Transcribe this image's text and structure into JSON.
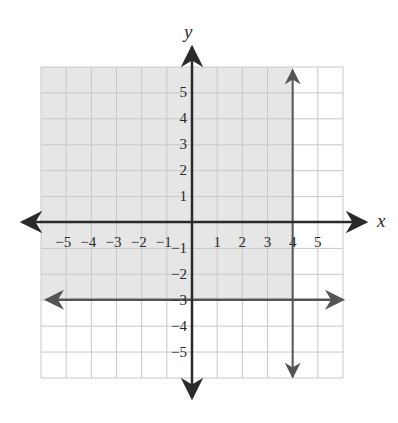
{
  "chart_data": {
    "type": "line",
    "title": "",
    "xlabel": "x",
    "ylabel": "y",
    "xlim": [
      -6,
      6
    ],
    "ylim": [
      -6,
      6
    ],
    "grid": true,
    "x_ticks": [
      -5,
      -4,
      -3,
      -2,
      -1,
      1,
      2,
      3,
      4,
      5
    ],
    "y_ticks": [
      5,
      4,
      3,
      2,
      1,
      -1,
      -2,
      -3,
      -4,
      -5
    ],
    "x_tick_labels": [
      "−5",
      "−4",
      "−3",
      "−2",
      "−1",
      "1",
      "2",
      "3",
      "4",
      "5"
    ],
    "y_tick_labels": [
      "5",
      "4",
      "3",
      "2",
      "1",
      "−1",
      "−2",
      "−3",
      "−4",
      "−5"
    ],
    "series": [
      {
        "name": "x = 4",
        "kind": "vertical_line",
        "x": 4,
        "style": "solid",
        "arrows": "both"
      },
      {
        "name": "y = -3",
        "kind": "horizontal_line",
        "y": -3,
        "style": "solid",
        "arrows": "both"
      }
    ],
    "shaded_region": {
      "description": "x < 4 and y > -3",
      "x_range": [
        -6,
        4
      ],
      "y_range": [
        -3,
        6
      ]
    },
    "colors": {
      "shade": "#e6e6e6",
      "grid": "#c8c8c8",
      "axis": "#2a2a2a",
      "boundary": "#555555"
    }
  }
}
